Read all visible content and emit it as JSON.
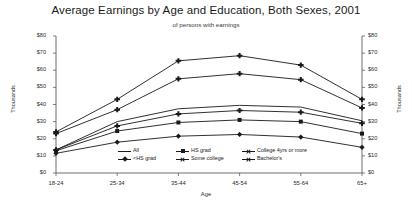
{
  "chart_data": {
    "type": "line",
    "title": "Average Earnings by Age and Education, Both Sexes, 2001",
    "subtitle": "of persons with earnings",
    "xlabel": "Age",
    "ylabel": "Thousands",
    "ylabel_right": "Thousands",
    "categories": [
      "18-24",
      "25-34",
      "35-44",
      "45-54",
      "55-64",
      "65+"
    ],
    "ylim": [
      0,
      80
    ],
    "ytick_values": [
      0,
      10,
      20,
      30,
      40,
      50,
      60,
      70,
      80
    ],
    "ytick_labels": [
      "$0",
      "$10",
      "$20",
      "$30",
      "$40",
      "$50",
      "$60",
      "$70",
      "$80"
    ],
    "grid": false,
    "legend_position": "bottom-center",
    "series": [
      {
        "name": "All",
        "marker": "line",
        "values": [
          13.5,
          30.0,
          37.5,
          39.5,
          38.5,
          30.5
        ]
      },
      {
        "name": "<HS grad",
        "marker": "diamond",
        "values": [
          11.5,
          18.0,
          21.5,
          22.5,
          21.0,
          15.0
        ]
      },
      {
        "name": "HS grad",
        "marker": "square",
        "values": [
          13.0,
          24.5,
          29.5,
          31.0,
          30.0,
          23.0
        ]
      },
      {
        "name": "Some college",
        "marker": "cross",
        "values": [
          13.5,
          27.5,
          34.5,
          36.5,
          35.5,
          29.0
        ]
      },
      {
        "name": "College 4yrs or more",
        "marker": "cross",
        "values": [
          24.0,
          43.0,
          65.5,
          68.5,
          63.0,
          43.0
        ]
      },
      {
        "name": "Bachelor's",
        "marker": "cross",
        "values": [
          23.0,
          37.0,
          55.0,
          58.0,
          54.5,
          38.0
        ]
      }
    ]
  },
  "legend": {
    "entries": [
      {
        "label": "All"
      },
      {
        "label": "HS grad"
      },
      {
        "label": "College 4yrs or more"
      },
      {
        "label": "<HS grad"
      },
      {
        "label": "Some college"
      },
      {
        "label": "Bachelor's"
      }
    ]
  }
}
